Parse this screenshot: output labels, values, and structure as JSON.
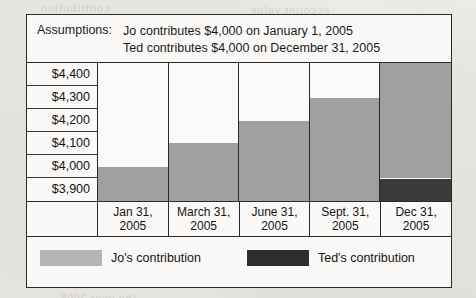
{
  "assumptions": {
    "label": "Assumptions:",
    "lines": [
      "Jo contributes $4,000 on January 1, 2005",
      "Ted contributes $4,000 on December 31, 2005"
    ]
  },
  "legend": {
    "jo": "Jo's contribution",
    "ted": "Ted's contribution"
  },
  "colors": {
    "jo": "#a0a0a0",
    "ted": "#3a3a3a",
    "frame": "#2a2a2a",
    "panel": "#faf9f7"
  },
  "chart_data": {
    "type": "bar",
    "title": "",
    "xlabel": "",
    "ylabel": "",
    "grid": true,
    "legend_position": "bottom",
    "ylim": [
      3900,
      4400
    ],
    "yticks": [
      "$4,400",
      "$4,300",
      "$4,200",
      "$4,100",
      "$4,000",
      "$3,900"
    ],
    "categories": [
      "Jan 31,\n2005",
      "March 31,\n2005",
      "June 31,\n2005",
      "Sept. 31,\n2005",
      "Dec 31,\n2005"
    ],
    "category_lines": [
      [
        "Jan 31,",
        "2005"
      ],
      [
        "March 31,",
        "2005"
      ],
      [
        "June 31,",
        "2005"
      ],
      [
        "Sept. 31,",
        "2005"
      ],
      [
        "Dec 31,",
        "2005"
      ]
    ],
    "series": [
      {
        "name": "Jo's contribution",
        "color": "#a0a0a0",
        "values": [
          4025,
          4110,
          4190,
          4275,
          4400
        ],
        "bottoms": [
          3900,
          3900,
          3900,
          3900,
          3985
        ]
      },
      {
        "name": "Ted's contribution",
        "color": "#3a3a3a",
        "values": [
          0,
          0,
          0,
          0,
          3985
        ],
        "bottoms": [
          3900,
          3900,
          3900,
          3900,
          3900
        ]
      }
    ]
  }
}
